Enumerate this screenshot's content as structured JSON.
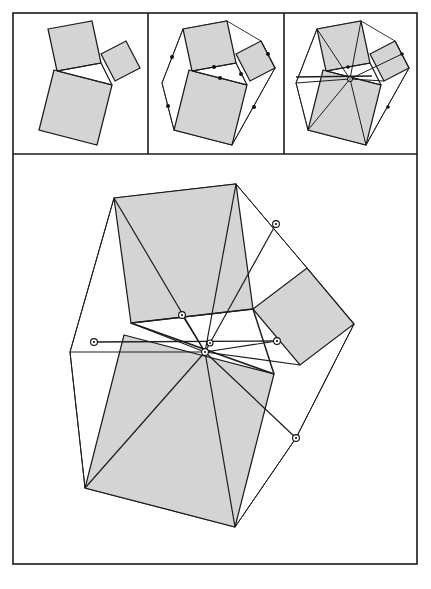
{
  "page": {
    "width": 431,
    "height": 589,
    "background": "#ffffff"
  },
  "style": {
    "shade_fill": "#d4d4d4",
    "stroke": "#1d1d1d",
    "frame_stroke": "#1b1b1b",
    "marker_fill": "#ffffff",
    "marker_stroke": "#111111",
    "thin_width": 0.9,
    "medium_width": 1.25,
    "thick_width": 1.7,
    "frame_width": 1.6
  },
  "frame": {
    "outer": {
      "x": 13,
      "y": 13,
      "width": 404,
      "height": 551
    },
    "divider_horizontal_y": 154,
    "divider_vertical_x": [
      148,
      284
    ]
  },
  "panels": [
    {
      "name": "panel-stage-1",
      "label": "Stage 1: three squares erected on the triangle sides",
      "box": {
        "x": 13,
        "y": 13,
        "width": 135,
        "height": 141
      },
      "shaded_polygons": [
        {
          "name": "square-on-side-a",
          "points": "48,29 92,21 101,63 57,71"
        },
        {
          "name": "square-on-side-b",
          "points": "101,54 126,41 140,68 115,81"
        },
        {
          "name": "square-on-side-c",
          "points": "54,70 112,85 97,145 39,130"
        }
      ],
      "open_polygons": [],
      "segments": [
        {
          "name": "triangle-side-top",
          "from": [
            57,
            71
          ],
          "to": [
            101,
            63
          ],
          "width": 1.25
        },
        {
          "name": "triangle-side-right",
          "from": [
            101,
            63
          ],
          "to": [
            112,
            85
          ],
          "width": 1.25
        },
        {
          "name": "triangle-side-left",
          "from": [
            57,
            71
          ],
          "to": [
            112,
            85
          ],
          "width": 1.25
        }
      ],
      "markers": []
    },
    {
      "name": "panel-stage-2",
      "label": "Stage 2: outer hull joined, side midpoints marked",
      "box": {
        "x": 148,
        "y": 13,
        "width": 136,
        "height": 141
      },
      "shaded_polygons": [
        {
          "name": "square-on-side-a",
          "points": "183,29 227,21 236,63 192,71"
        },
        {
          "name": "square-on-side-b",
          "points": "236,54 261,41 275,68 250,81"
        },
        {
          "name": "square-on-side-c",
          "points": "189,70 247,85 232,145 174,130"
        }
      ],
      "open_polygons": [
        {
          "name": "outer-hull",
          "points": "183,29 227,21 261,41 275,68 232,145 174,130 162,83",
          "width": 0.9,
          "closed": true
        }
      ],
      "segments": [
        {
          "name": "triangle-side-top",
          "from": [
            192,
            71
          ],
          "to": [
            236,
            63
          ],
          "width": 1.25
        },
        {
          "name": "triangle-side-right",
          "from": [
            236,
            63
          ],
          "to": [
            247,
            85
          ],
          "width": 1.25
        },
        {
          "name": "triangle-side-left",
          "from": [
            192,
            71
          ],
          "to": [
            247,
            85
          ],
          "width": 1.25
        },
        {
          "name": "hull-edge-left-upper",
          "from": [
            183,
            29
          ],
          "to": [
            162,
            83
          ],
          "width": 0.9
        },
        {
          "name": "hull-edge-left-lower",
          "from": [
            162,
            83
          ],
          "to": [
            174,
            130
          ],
          "width": 0.9
        },
        {
          "name": "hull-edge-right-upper",
          "from": [
            261,
            41
          ],
          "to": [
            275,
            68
          ],
          "width": 0.9
        },
        {
          "name": "hull-edge-right-lower",
          "from": [
            275,
            68
          ],
          "to": [
            232,
            145
          ],
          "width": 0.9
        }
      ],
      "markers": [
        {
          "name": "midpoint-dot-top",
          "cx": 214,
          "cy": 67,
          "type": "solid",
          "r": 2.0
        },
        {
          "name": "midpoint-dot-inner",
          "cx": 220,
          "cy": 78,
          "type": "solid",
          "r": 2.0
        },
        {
          "name": "midpoint-dot-right",
          "cx": 241,
          "cy": 74,
          "type": "solid",
          "r": 2.0
        },
        {
          "name": "midpoint-dot-hull-right",
          "cx": 268,
          "cy": 54,
          "type": "solid",
          "r": 2.0
        },
        {
          "name": "midpoint-dot-hull-lower-right",
          "cx": 254,
          "cy": 107,
          "type": "solid",
          "r": 2.0
        },
        {
          "name": "midpoint-dot-hull-left",
          "cx": 172,
          "cy": 57,
          "type": "solid",
          "r": 2.0
        },
        {
          "name": "midpoint-dot-hull-lower-left",
          "cx": 168,
          "cy": 106,
          "type": "solid",
          "r": 2.0
        }
      ]
    },
    {
      "name": "panel-stage-3",
      "label": "Stage 3: cevians drawn, all concurrent at a central point",
      "box": {
        "x": 284,
        "y": 13,
        "width": 133,
        "height": 141
      },
      "shaded_polygons": [
        {
          "name": "square-on-side-a",
          "points": "317,29 361,21 370,63 326,71"
        },
        {
          "name": "square-on-side-b",
          "points": "370,54 395,41 409,68 384,81"
        },
        {
          "name": "square-on-side-c",
          "points": "323,70 381,85 366,145 308,130"
        }
      ],
      "open_polygons": [
        {
          "name": "outer-hull",
          "points": "317,29 361,21 395,41 409,68 366,145 308,130 296,83",
          "width": 0.9,
          "closed": true
        }
      ],
      "segments": [
        {
          "name": "triangle-side-top",
          "from": [
            326,
            71
          ],
          "to": [
            370,
            63
          ],
          "width": 1.25
        },
        {
          "name": "triangle-side-right",
          "from": [
            370,
            63
          ],
          "to": [
            381,
            85
          ],
          "width": 1.25
        },
        {
          "name": "triangle-side-left",
          "from": [
            326,
            71
          ],
          "to": [
            381,
            85
          ],
          "width": 1.25
        },
        {
          "name": "hull-edge-left-upper",
          "from": [
            317,
            29
          ],
          "to": [
            296,
            83
          ],
          "width": 0.9
        },
        {
          "name": "hull-edge-left-lower",
          "from": [
            296,
            83
          ],
          "to": [
            308,
            130
          ],
          "width": 0.9
        },
        {
          "name": "hull-edge-right-upper",
          "from": [
            395,
            41
          ],
          "to": [
            409,
            68
          ],
          "width": 0.9
        },
        {
          "name": "hull-edge-right-lower",
          "from": [
            409,
            68
          ],
          "to": [
            366,
            145
          ],
          "width": 0.9
        },
        {
          "name": "cevian-from-top-left",
          "from": [
            317,
            29
          ],
          "to": [
            350,
            79
          ],
          "width": 1.0
        },
        {
          "name": "cevian-from-top-right",
          "from": [
            361,
            21
          ],
          "to": [
            350,
            79
          ],
          "width": 1.0
        },
        {
          "name": "cevian-from-hull-right",
          "from": [
            402,
            54
          ],
          "to": [
            350,
            79
          ],
          "width": 1.0
        },
        {
          "name": "cevian-from-hull-lower-right",
          "from": [
            366,
            145
          ],
          "to": [
            350,
            79
          ],
          "width": 1.0
        },
        {
          "name": "cevian-from-hull-lower-left",
          "from": [
            308,
            130
          ],
          "to": [
            350,
            79
          ],
          "width": 1.0
        },
        {
          "name": "cevian-from-hull-left",
          "from": [
            296,
            83
          ],
          "to": [
            350,
            79
          ],
          "width": 1.0
        },
        {
          "name": "horizontal-axis",
          "from": [
            296,
            77
          ],
          "to": [
            372,
            76
          ],
          "width": 1.4
        },
        {
          "name": "cevian-from-square-b",
          "from": [
            384,
            81
          ],
          "to": [
            350,
            79
          ],
          "width": 1.0
        }
      ],
      "markers": [
        {
          "name": "center-point",
          "cx": 350,
          "cy": 79,
          "type": "ring",
          "r": 2.4
        },
        {
          "name": "midpoint-dot-top",
          "cx": 348,
          "cy": 67,
          "type": "solid",
          "r": 1.8
        },
        {
          "name": "midpoint-dot-hull-right",
          "cx": 402,
          "cy": 54,
          "type": "solid",
          "r": 1.8
        },
        {
          "name": "midpoint-dot-hull-lower-right",
          "cx": 388,
          "cy": 107,
          "type": "solid",
          "r": 1.8
        }
      ]
    }
  ],
  "main_panel": {
    "name": "panel-main-enlarged",
    "label": "Enlarged final construction",
    "box": {
      "x": 13,
      "y": 154,
      "width": 404,
      "height": 410
    },
    "shaded_polygons": [
      {
        "name": "square-on-side-a-large",
        "points": "114,198 236,184 253,309 131,323"
      },
      {
        "name": "square-on-side-b-large",
        "points": "253,309 307,268 354,324 300,365"
      },
      {
        "name": "square-on-side-c-large",
        "points": "124,335 274,374 235,527 85,488"
      }
    ],
    "open_polygons": [
      {
        "name": "outer-hull-large",
        "points": "114,198 236,184 307,268 354,324 296,438 235,527 85,488 70,352",
        "width": 1.0,
        "closed": true
      }
    ],
    "segments": [
      {
        "name": "triangle-side-top",
        "from": [
          131,
          323
        ],
        "to": [
          253,
          309
        ],
        "width": 1.5
      },
      {
        "name": "triangle-side-right",
        "from": [
          253,
          309
        ],
        "to": [
          274,
          374
        ],
        "width": 1.5
      },
      {
        "name": "triangle-side-left",
        "from": [
          131,
          323
        ],
        "to": [
          274,
          374
        ],
        "width": 1.5
      },
      {
        "name": "hull-edge-left-upper",
        "from": [
          114,
          198
        ],
        "to": [
          70,
          352
        ],
        "width": 1.0
      },
      {
        "name": "hull-edge-left-lower",
        "from": [
          70,
          352
        ],
        "to": [
          85,
          488
        ],
        "width": 1.0
      },
      {
        "name": "hull-edge-top-right",
        "from": [
          236,
          184
        ],
        "to": [
          307,
          268
        ],
        "width": 1.0
      },
      {
        "name": "hull-edge-right",
        "from": [
          354,
          324
        ],
        "to": [
          296,
          438
        ],
        "width": 1.0
      },
      {
        "name": "hull-edge-right-lower",
        "from": [
          296,
          438
        ],
        "to": [
          235,
          527
        ],
        "width": 1.0
      },
      {
        "name": "cevian-top-left-to-center",
        "from": [
          114,
          198
        ],
        "to": [
          205,
          352
        ],
        "width": 1.2
      },
      {
        "name": "cevian-top-right-to-center",
        "from": [
          236,
          184
        ],
        "to": [
          205,
          352
        ],
        "width": 1.2
      },
      {
        "name": "cevian-hull-right-to-center",
        "from": [
          276,
          224
        ],
        "to": [
          205,
          352
        ],
        "width": 1.2
      },
      {
        "name": "cevian-right-lower-to-center",
        "from": [
          296,
          438
        ],
        "to": [
          205,
          352
        ],
        "width": 1.2
      },
      {
        "name": "cevian-bottom-to-center",
        "from": [
          235,
          527
        ],
        "to": [
          205,
          352
        ],
        "width": 1.2
      },
      {
        "name": "cevian-hull-lower-left-to-center",
        "from": [
          85,
          488
        ],
        "to": [
          205,
          352
        ],
        "width": 1.2
      },
      {
        "name": "cevian-hull-left-to-center",
        "from": [
          70,
          352
        ],
        "to": [
          205,
          352
        ],
        "width": 1.2
      },
      {
        "name": "cevian-square-b-to-center",
        "from": [
          300,
          365
        ],
        "to": [
          205,
          352
        ],
        "width": 1.2
      },
      {
        "name": "horizontal-axis-large",
        "from": [
          94,
          342
        ],
        "to": [
          277,
          341
        ],
        "width": 1.4
      },
      {
        "name": "chord-mid-left",
        "from": [
          131,
          323
        ],
        "to": [
          205,
          352
        ],
        "width": 1.2
      },
      {
        "name": "chord-mid-top",
        "from": [
          182,
          315
        ],
        "to": [
          205,
          352
        ],
        "width": 1.2
      },
      {
        "name": "chord-mid-right",
        "from": [
          277,
          341
        ],
        "to": [
          205,
          352
        ],
        "width": 1.2
      }
    ],
    "markers": [
      {
        "name": "center-point",
        "cx": 210,
        "cy": 343,
        "type": "ring",
        "r": 3.0
      },
      {
        "name": "center-point-lower",
        "cx": 205,
        "cy": 352,
        "type": "ring",
        "r": 3.4
      },
      {
        "name": "midpoint-top-edge",
        "cx": 182,
        "cy": 315,
        "type": "ring",
        "r": 3.4
      },
      {
        "name": "midpoint-hull-upper-right",
        "cx": 276,
        "cy": 224,
        "type": "ring",
        "r": 3.4
      },
      {
        "name": "midpoint-right-edge",
        "cx": 277,
        "cy": 341,
        "type": "ring",
        "r": 3.4
      },
      {
        "name": "midpoint-hull-left",
        "cx": 94,
        "cy": 342,
        "type": "ring",
        "r": 3.4
      },
      {
        "name": "midpoint-hull-lower-right",
        "cx": 296,
        "cy": 438,
        "type": "ring",
        "r": 3.4
      }
    ]
  },
  "caption": {
    "text": "",
    "visible": false
  }
}
